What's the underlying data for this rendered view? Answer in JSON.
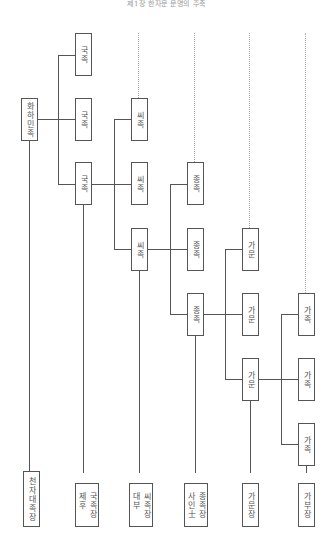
{
  "header": {
    "title": "제1장 한자문 문명의 주축"
  },
  "diagram": {
    "root": {
      "label": "화하민족"
    },
    "columns": [
      {
        "name": "국족",
        "nodes": [
          "국족",
          "국족",
          "국족"
        ]
      },
      {
        "name": "씨족",
        "nodes": [
          "씨족",
          "씨족",
          "씨족"
        ]
      },
      {
        "name": "종족",
        "nodes": [
          "종족",
          "종족",
          "종족"
        ]
      },
      {
        "name": "가문",
        "nodes": [
          "가문",
          "가문",
          "가문"
        ]
      },
      {
        "name": "가족",
        "nodes": [
          "가족",
          "가족",
          "가족"
        ]
      }
    ],
    "leaders": [
      {
        "lines": [
          "천자대족장"
        ]
      },
      {
        "lines": [
          "국족장",
          "제후"
        ]
      },
      {
        "lines": [
          "씨족장",
          "대부"
        ]
      },
      {
        "lines": [
          "종족장",
          "사인士"
        ]
      },
      {
        "lines": [
          "가문장"
        ]
      },
      {
        "lines": [
          "가부장"
        ]
      }
    ]
  }
}
